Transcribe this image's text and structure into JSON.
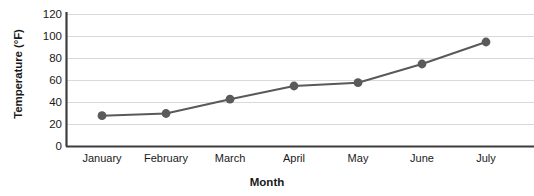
{
  "chart_data": {
    "type": "line",
    "title": "",
    "xlabel": "Month",
    "ylabel": "Temperature (°F)",
    "categories": [
      "January",
      "February",
      "March",
      "April",
      "May",
      "June",
      "July"
    ],
    "values": [
      28,
      30,
      43,
      55,
      58,
      75,
      95
    ],
    "series": [
      {
        "name": "Temperature",
        "values": [
          28,
          30,
          43,
          55,
          58,
          75,
          95
        ]
      }
    ],
    "ylim": [
      0,
      120
    ],
    "yticks": [
      "0",
      "20",
      "40",
      "60",
      "80",
      "100",
      "120"
    ],
    "ytick_values": [
      0,
      20,
      40,
      60,
      80,
      100,
      120
    ],
    "grid": "horizontal",
    "legend": "none",
    "marker": "circle",
    "line_color": "#595959",
    "marker_color": "#5a5a5a",
    "grid_color": "#d9d9d9",
    "axis_color": "#404040",
    "background": "#ffffff"
  },
  "axes": {
    "y_title": "Temperature (°F)",
    "x_title": "Month"
  }
}
